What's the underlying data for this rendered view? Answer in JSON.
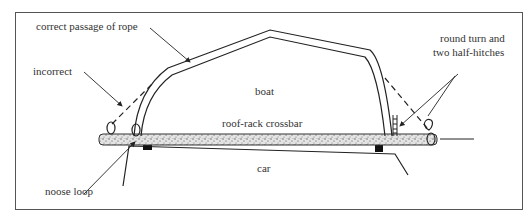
{
  "diagram": {
    "labels": {
      "correct": "correct passage of rope",
      "incorrect": "incorrect",
      "boat": "boat",
      "crossbar": "roof-rack crossbar",
      "car": "car",
      "noose": "noose loop",
      "hitch_line1": "round turn and",
      "hitch_line2": "two half-hitches"
    },
    "colors": {
      "ink": "#222222",
      "frame": "#555555",
      "text": "#333333",
      "crossbar_fill": "#d8d8d8"
    }
  }
}
